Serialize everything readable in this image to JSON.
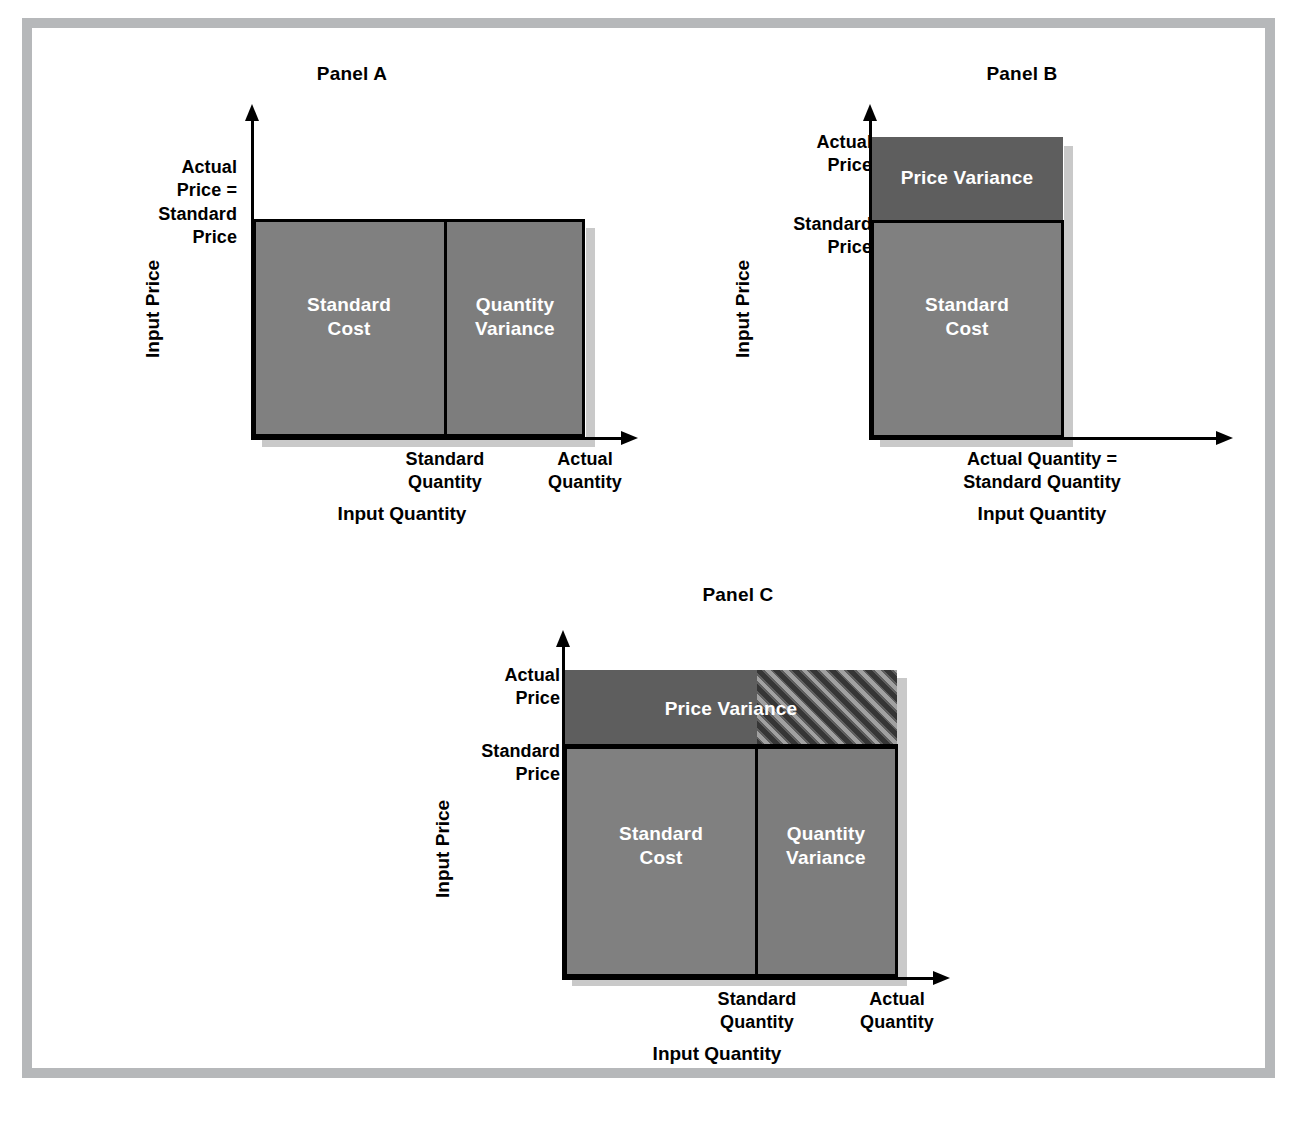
{
  "figure": {
    "type": "diagram",
    "frame_color": "#b6b8ba",
    "colors": {
      "standard_cost_fill": "#808080",
      "quantity_variance_fill": "#7d7d7d",
      "price_variance_fill": "#5e5e5e",
      "outline": "#000000",
      "shadow": "#c9c9c9",
      "region_text": "#ffffff"
    }
  },
  "panels": [
    {
      "id": "panel-a",
      "title": "Panel A",
      "y_axis_title": "Input Price",
      "x_axis_title": "Input Quantity",
      "y_ticks": [
        {
          "id": "actual-equals-standard-price",
          "text": "Actual\nPrice =\nStandard\nPrice"
        }
      ],
      "x_ticks": [
        {
          "id": "standard-quantity",
          "text": "Standard\nQuantity"
        },
        {
          "id": "actual-quantity",
          "text": "Actual\nQuantity"
        }
      ],
      "regions": [
        {
          "id": "standard-cost",
          "label": "Standard\nCost",
          "fill": "standard_cost_fill",
          "hatched": false
        },
        {
          "id": "quantity-variance",
          "label": "Quantity\nVariance",
          "fill": "quantity_variance_fill",
          "hatched": false
        }
      ]
    },
    {
      "id": "panel-b",
      "title": "Panel B",
      "y_axis_title": "Input Price",
      "x_axis_title": "Input Quantity",
      "y_ticks": [
        {
          "id": "actual-price",
          "text": "Actual\nPrice"
        },
        {
          "id": "standard-price",
          "text": "Standard\nPrice"
        }
      ],
      "x_ticks": [
        {
          "id": "actual-equals-standard-quantity",
          "text": "Actual Quantity =\nStandard Quantity"
        }
      ],
      "regions": [
        {
          "id": "price-variance",
          "label": "Price Variance",
          "fill": "price_variance_fill",
          "hatched": false
        },
        {
          "id": "standard-cost",
          "label": "Standard\nCost",
          "fill": "standard_cost_fill",
          "hatched": false
        }
      ]
    },
    {
      "id": "panel-c",
      "title": "Panel C",
      "y_axis_title": "Input Price",
      "x_axis_title": "Input Quantity",
      "y_ticks": [
        {
          "id": "actual-price",
          "text": "Actual\nPrice"
        },
        {
          "id": "standard-price",
          "text": "Standard\nPrice"
        }
      ],
      "x_ticks": [
        {
          "id": "standard-quantity",
          "text": "Standard\nQuantity"
        },
        {
          "id": "actual-quantity",
          "text": "Actual\nQuantity"
        }
      ],
      "regions": [
        {
          "id": "price-variance",
          "label": "Price Variance",
          "fill": "price_variance_fill",
          "hatched": false
        },
        {
          "id": "joint-variance-hatched",
          "label": "",
          "fill": "price_variance_fill",
          "hatched": true
        },
        {
          "id": "standard-cost",
          "label": "Standard\nCost",
          "fill": "standard_cost_fill",
          "hatched": false
        },
        {
          "id": "quantity-variance",
          "label": "Quantity\nVariance",
          "fill": "quantity_variance_fill",
          "hatched": false
        }
      ]
    }
  ]
}
